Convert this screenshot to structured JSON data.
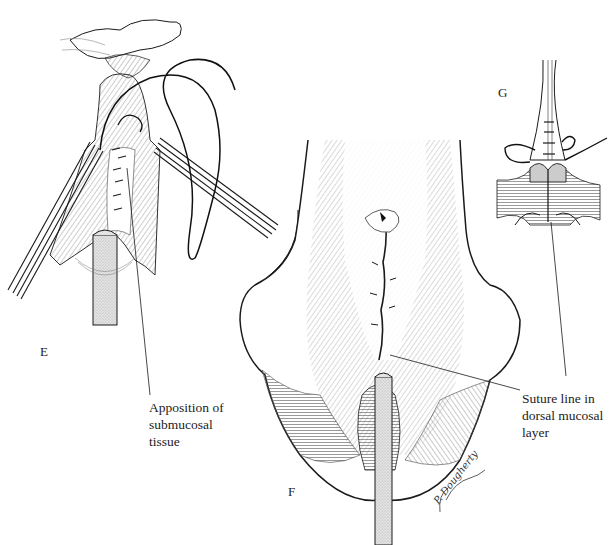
{
  "figure": {
    "panels": [
      {
        "id": "E",
        "label": "E"
      },
      {
        "id": "F",
        "label": "F"
      },
      {
        "id": "G",
        "label": "G"
      }
    ],
    "callouts": {
      "submucosal": {
        "lines": [
          "Apposition of",
          "submucosal",
          "tissue"
        ]
      },
      "suture_line": {
        "lines": [
          "Suture line in",
          "dorsal mucosal",
          "layer"
        ]
      }
    },
    "signature": "P. Dougherty"
  },
  "colors": {
    "ink": "#1a1a1a",
    "hatch": "#555555",
    "catheter_fill": "#d9d9d9",
    "background": "#ffffff"
  }
}
